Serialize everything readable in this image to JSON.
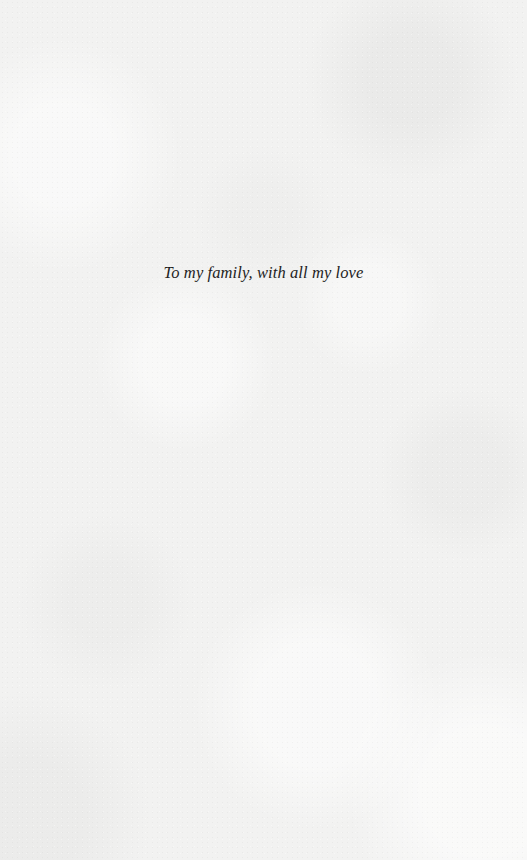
{
  "page": {
    "type": "dedication",
    "background_color": "#f2f2f1",
    "text_color": "#1e1e1e"
  },
  "dedication": {
    "text": "To my family, with all my love"
  }
}
